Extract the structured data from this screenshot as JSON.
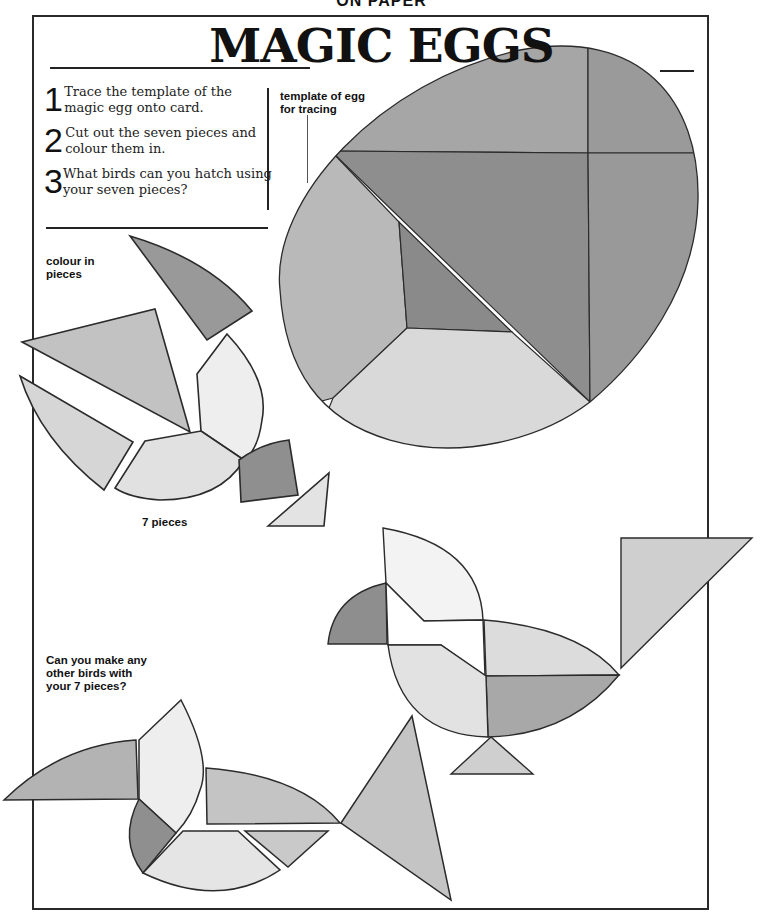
{
  "page": {
    "header_cropped": "ON PAPER",
    "title": "MAGIC EGGS"
  },
  "instructions": [
    {
      "number": "1",
      "text": "Trace the template of the magic egg onto card."
    },
    {
      "number": "2",
      "text": "Cut out the seven pieces and colour them in."
    },
    {
      "number": "3",
      "text": "What birds can you hatch using your seven pieces?"
    }
  ],
  "labels": {
    "template": "template of egg\nfor tracing",
    "colour_in": "colour in\npieces",
    "seven_pieces": "7 pieces",
    "other_birds": "Can you make any\nother birds with\nyour 7 pieces?"
  },
  "colors": {
    "dark": "#8e8e8e",
    "mid": "#adadad",
    "light": "#cfcfcf",
    "pale": "#e6e6e6",
    "white": "#f6f6f6",
    "outline": "#2b2b2b",
    "frame": "#2a2a2a"
  },
  "figures": {
    "egg_template": "template of egg for tracing, 7 pieces",
    "loose_pieces": "colour in pieces, 7 pieces",
    "bird_1": "bird made of 7 pieces (upright)",
    "bird_2": "bird made of 7 pieces (long beak)"
  }
}
